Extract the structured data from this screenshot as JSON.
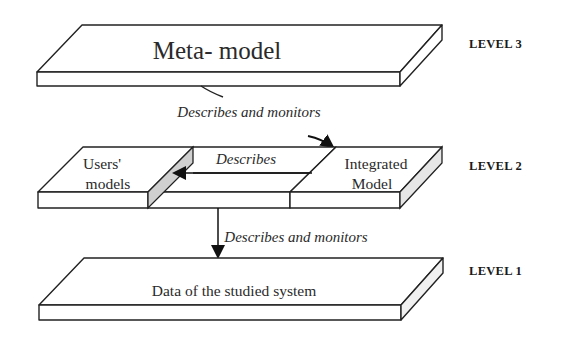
{
  "diagram": {
    "levels": [
      {
        "id": "level3",
        "label": "LEVEL 3",
        "slab_text": "Meta- model"
      },
      {
        "id": "level2",
        "label": "LEVEL 2",
        "parts": [
          {
            "id": "users-models",
            "line1": "Users'",
            "line2": "models"
          },
          {
            "id": "integrated-model",
            "line1": "Integrated",
            "line2": "Model"
          }
        ]
      },
      {
        "id": "level1",
        "label": "LEVEL 1",
        "slab_text": "Data of the studied system"
      }
    ],
    "arrows": [
      {
        "id": "l3-to-l2",
        "from": "Meta- model",
        "to": "Integrated Model",
        "label": "Describes and monitors"
      },
      {
        "id": "integrated-to-users",
        "from": "Integrated Model",
        "to": "Users' models",
        "label": "Describes"
      },
      {
        "id": "l2-to-l1",
        "from": "Level 2",
        "to": "Data of the studied system",
        "label": "Describes and monitors"
      }
    ],
    "colors": {
      "stroke": "#222222",
      "shade": "#d0d0d0",
      "background": "#ffffff"
    }
  }
}
